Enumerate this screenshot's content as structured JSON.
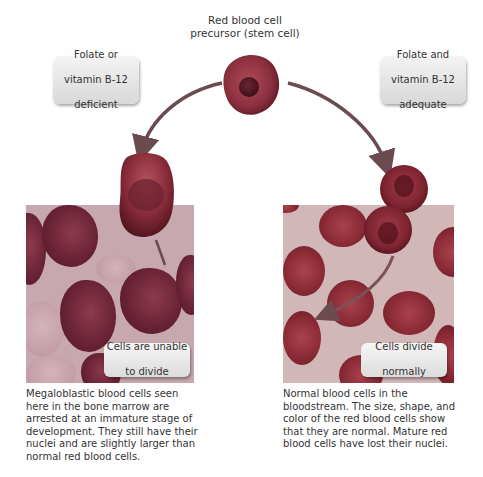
{
  "diagram": {
    "top": {
      "label": "Red blood cell\nprecursor (stem cell)",
      "label_lines": [
        "Red blood cell",
        "precursor (stem cell)"
      ]
    },
    "left_condition": {
      "label_lines": [
        "Folate or",
        "vitamin B-12",
        "deficient"
      ]
    },
    "right_condition": {
      "label_lines": [
        "Folate and",
        "vitamin B-12",
        "adequate"
      ]
    },
    "left_panel": {
      "callout_lines": [
        "Cells are unable",
        "to divide"
      ],
      "caption": "Megaloblastic blood cells seen here in the bone marrow are arrested at an immature stage of development. They still have their nuclei and are slightly larger than normal red blood cells."
    },
    "right_panel": {
      "callout_lines": [
        "Cells divide",
        "normally"
      ],
      "caption": "Normal blood cells in the bloodstream. The size, shape, and color of the red blood cells show that they are normal. Mature red blood cells have lost their nuclei."
    },
    "colors": {
      "cell_dark": "#6a2336",
      "rbc": "#8c2c37",
      "arrow": "#6b4a50",
      "box_fill": "#e6e6e6"
    }
  }
}
